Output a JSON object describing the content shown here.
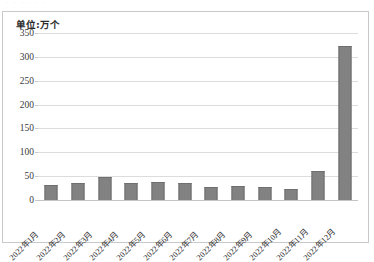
{
  "top_sliver_text": "· · · · · ·",
  "unit_label": "单位:万个",
  "colors": {
    "bar_fill": "#828282",
    "bar_edge": "#6f6f6f",
    "gridline": "#dcdcdc",
    "frame": "#c9c9c9",
    "background": "#ffffff",
    "tick_text": "#3a3a3a"
  },
  "chart_data": {
    "type": "bar",
    "title": "",
    "subtitle": "",
    "xlabel": "",
    "ylabel": "单位:万个",
    "ylim": [
      0,
      350
    ],
    "yticks": [
      0,
      50,
      100,
      150,
      200,
      250,
      300,
      350
    ],
    "ytick_labels": [
      "0",
      "50",
      "100",
      "150",
      "200",
      "250",
      "300",
      "350"
    ],
    "grid": true,
    "legend": false,
    "legend_position": "none",
    "categories": [
      "2022年1月",
      "2022年2月",
      "2022年3月",
      "2022年4月",
      "2022年5月",
      "2022年6月",
      "2022年7月",
      "2022年8月",
      "2022年9月",
      "2022年10月",
      "2022年11月",
      "2022年12月"
    ],
    "values": [
      31,
      35,
      48,
      36,
      37,
      35,
      27,
      30,
      27,
      24,
      61,
      322
    ],
    "series": [
      {
        "name": "",
        "values": [
          31,
          35,
          48,
          36,
          37,
          35,
          27,
          30,
          27,
          24,
          61,
          322
        ]
      }
    ],
    "annotations": []
  }
}
